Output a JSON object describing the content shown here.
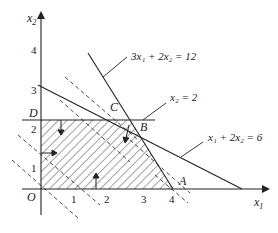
{
  "diagram": {
    "type": "linear-programming-feasible-region",
    "axes": {
      "x_label": "x1",
      "y_label": "x2",
      "origin_label": "O",
      "x_ticks": [
        "1",
        "2",
        "3",
        "4"
      ],
      "y_ticks": [
        "1",
        "2",
        "3",
        "4"
      ]
    },
    "constraints": [
      {
        "label": "3x1 + 2x2 = 12"
      },
      {
        "label": "x2 = 2"
      },
      {
        "label": "x1 + 2x2 = 6"
      }
    ],
    "points": {
      "A": "A",
      "B": "B",
      "C": "C",
      "D": "D"
    },
    "feasible_region": "hatched polygon O-D'-B-A",
    "objective_lines": "dashed parallel lines"
  },
  "labels": {
    "x_axis": "x",
    "x_axis_sub": "1",
    "y_axis": "x",
    "y_axis_sub": "2",
    "origin": "O",
    "tick_x1": "1",
    "tick_x2": "2",
    "tick_x3": "3",
    "tick_x4": "4",
    "tick_y1": "1",
    "tick_y2": "2",
    "tick_y3": "3",
    "tick_y4": "4",
    "point_A": "A",
    "point_B": "B",
    "point_C": "C",
    "point_D": "D",
    "eq1": "3x₁ + 2x₂ = 12",
    "eq2": "x₂ = 2",
    "eq3": "x₁ + 2x₂ = 6"
  }
}
